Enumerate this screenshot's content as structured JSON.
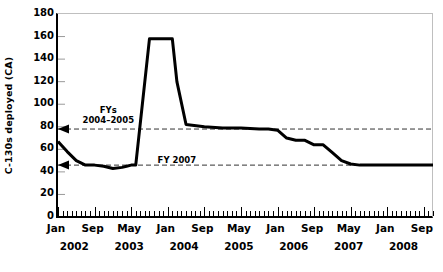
{
  "chart_data": {
    "type": "line",
    "title": "",
    "xlabel": "",
    "ylabel": "C-130s deployed (CA)",
    "ylim": [
      0,
      180
    ],
    "ytick_values": [
      0,
      20,
      40,
      60,
      80,
      100,
      120,
      140,
      160,
      180
    ],
    "ytick_labels": [
      "0",
      "20",
      "40",
      "60",
      "80",
      "100",
      "120",
      "140",
      "160",
      "180"
    ],
    "grid": false,
    "legend": "none",
    "x_axis": {
      "start": "2002-01",
      "end": "2008-11",
      "tick_interval_months": 1,
      "label_interval_months": 8,
      "tick_labels": [
        "Jan",
        "Sep",
        "May",
        "Jan",
        "Sep",
        "May",
        "Jan",
        "Sep",
        "May",
        "Jan",
        "Sep"
      ],
      "tick_label_months": [
        0,
        8,
        16,
        24,
        32,
        40,
        48,
        56,
        64,
        72,
        80
      ],
      "year_labels": [
        "2002",
        "2003",
        "2004",
        "2005",
        "2006",
        "2007",
        "2008"
      ],
      "year_label_months": [
        4,
        16,
        28,
        40,
        52,
        64,
        76
      ]
    },
    "series": [
      {
        "name": "C-130s deployed (CA)",
        "color": "#000000",
        "x_months": [
          0,
          2,
          4,
          6,
          8,
          10,
          12,
          14,
          15,
          16,
          17,
          20,
          22,
          24,
          25,
          26,
          28,
          32,
          36,
          40,
          44,
          46,
          48,
          50,
          52,
          54,
          56,
          58,
          60,
          62,
          64,
          66,
          70,
          76,
          82
        ],
        "values": [
          67,
          58,
          50,
          46,
          46,
          45,
          43,
          44,
          45,
          46,
          46,
          158,
          158,
          158,
          158,
          120,
          82,
          80,
          79,
          79,
          78,
          78,
          77,
          70,
          68,
          68,
          64,
          64,
          57,
          50,
          47,
          46,
          46,
          46,
          46
        ]
      }
    ],
    "reference_lines": [
      {
        "label": "FYs 2004–2005",
        "value": 78,
        "style": "dashed",
        "arrow": "left"
      },
      {
        "label": "FY 2007",
        "value": 46,
        "style": "dashed",
        "arrow": "left"
      }
    ],
    "annotations": [
      {
        "text_line1": "FYs",
        "text_line2": "2004–2005",
        "at_month": 11,
        "at_value": 99
      },
      {
        "text_line1": "FY 2007",
        "text_line2": "",
        "at_month": 26,
        "at_value": 55
      }
    ]
  },
  "colors": {
    "line": "#000000",
    "axis": "#000000",
    "frame": "#bfbfbf",
    "reference": "#333333",
    "background": "#ffffff"
  }
}
